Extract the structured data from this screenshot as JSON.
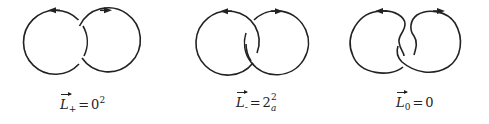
{
  "figure": {
    "stroke_color": "#222222",
    "background": "#ffffff",
    "panels": [
      {
        "id": "L-plus",
        "label": {
          "symbol": "L",
          "subscript": "+",
          "equals": "=",
          "rhs_base": "0",
          "rhs_superscript": "2",
          "rhs_subscript": ""
        },
        "crossing": "positive"
      },
      {
        "id": "L-minus",
        "label": {
          "symbol": "L",
          "subscript": "-",
          "equals": "=",
          "rhs_base": "2",
          "rhs_superscript": "2",
          "rhs_subscript": "a"
        },
        "crossing": "negative"
      },
      {
        "id": "L-zero",
        "label": {
          "symbol": "L",
          "subscript": "0",
          "equals": "=",
          "rhs_base": "0",
          "rhs_superscript": "",
          "rhs_subscript": ""
        },
        "crossing": "smoothed"
      }
    ]
  }
}
